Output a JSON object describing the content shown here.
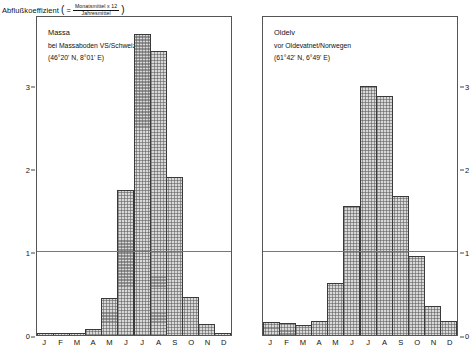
{
  "axis_caption": {
    "label": "Abflußkoeffizient",
    "open_paren": "(",
    "eq": "=",
    "numerator": "Monatsmittel x 12",
    "denominator": "Jahresmittel",
    "close_paren": ")"
  },
  "chart_data": [
    {
      "type": "bar",
      "title": "Massa",
      "subtitle": "bei Massaboden VS/Schweiz",
      "coords": "(46°20' N, 8°01' E)",
      "xlabel": "",
      "ylabel": "Abflußkoeffizient",
      "categories": [
        "J",
        "F",
        "M",
        "A",
        "M",
        "J",
        "J",
        "A",
        "S",
        "O",
        "N",
        "D"
      ],
      "values": [
        0.02,
        0.02,
        0.02,
        0.07,
        0.45,
        1.75,
        3.62,
        3.42,
        1.9,
        0.46,
        0.13,
        0.02
      ],
      "ylim": [
        0,
        3.85
      ],
      "yticks": [
        0,
        1,
        2,
        3
      ],
      "ytick_labels": [
        "0",
        "1",
        "2",
        "3"
      ],
      "gridlines": [
        1
      ],
      "grid": false,
      "legend": "none",
      "tick_side": "left"
    },
    {
      "type": "bar",
      "title": "Oldelv",
      "subtitle": "vor Oldevatnet/Norwegen",
      "coords": "(61°42' N, 6°49' E)",
      "xlabel": "",
      "ylabel": "Abflußkoeffizient",
      "categories": [
        "J",
        "F",
        "M",
        "A",
        "M",
        "J",
        "J",
        "A",
        "S",
        "O",
        "N",
        "D"
      ],
      "values": [
        0.16,
        0.15,
        0.12,
        0.17,
        0.62,
        1.55,
        3.0,
        2.87,
        1.67,
        0.95,
        0.35,
        0.17
      ],
      "ylim": [
        0,
        3.85
      ],
      "yticks": [
        0,
        1,
        2,
        3
      ],
      "ytick_labels": [
        "0",
        "1",
        "2",
        "3"
      ],
      "gridlines": [
        1
      ],
      "grid": false,
      "legend": "none",
      "tick_side": "right"
    }
  ]
}
